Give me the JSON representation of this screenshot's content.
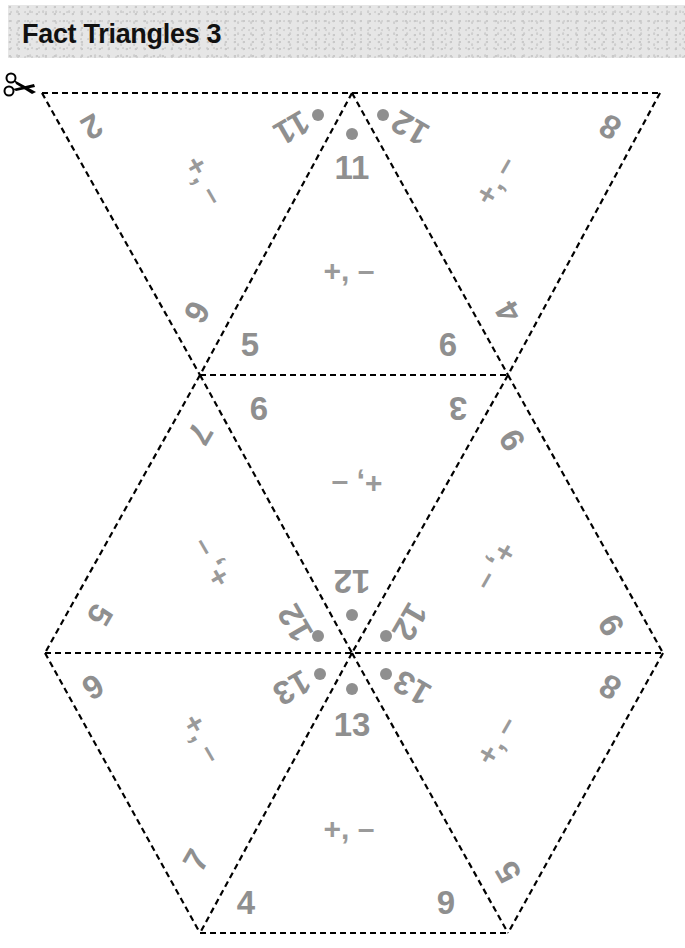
{
  "header": {
    "title": "Fact Triangles 3"
  },
  "icons": {
    "scissors": "scissors-icon"
  },
  "colors": {
    "number": "#8f8f8f",
    "cut_line": "#000000",
    "header_band": "#e6e6e6"
  },
  "triangles": [
    {
      "id": 1,
      "orientation": "down",
      "sum": "11",
      "addends": [
        "2",
        "9"
      ],
      "operation": "+, –"
    },
    {
      "id": 2,
      "orientation": "up",
      "sum": "11",
      "addends": [
        "5",
        "6"
      ],
      "operation": "+, –"
    },
    {
      "id": 3,
      "orientation": "down",
      "sum": "12",
      "addends": [
        "8",
        "4"
      ],
      "operation": "+, –"
    },
    {
      "id": 4,
      "orientation": "up",
      "sum": "12",
      "addends": [
        "7",
        "5"
      ],
      "operation": "+, –"
    },
    {
      "id": 5,
      "orientation": "down",
      "sum": "12",
      "addends": [
        "6",
        "3"
      ],
      "operation": "+, –"
    },
    {
      "id": 6,
      "orientation": "up",
      "sum": "12",
      "addends": [
        "9",
        "9"
      ],
      "operation": "+, –"
    },
    {
      "id": 7,
      "orientation": "down",
      "sum": "13",
      "addends": [
        "6",
        "7"
      ],
      "operation": "+, –"
    },
    {
      "id": 8,
      "orientation": "up",
      "sum": "13",
      "addends": [
        "4",
        "9"
      ],
      "operation": "+, –"
    },
    {
      "id": 9,
      "orientation": "down",
      "sum": "13",
      "addends": [
        "8",
        "5"
      ],
      "operation": "+, –"
    }
  ]
}
